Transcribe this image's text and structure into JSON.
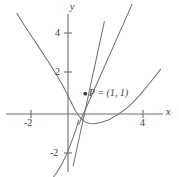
{
  "figure": {
    "name": "cubic-curve-with-tangent-and-secant",
    "background": "#ffffff",
    "curve_color": "#737373",
    "axis_color": "#6e6e6e",
    "text_color": "#3a3a3a",
    "axis_labels": {
      "x": "x",
      "y": "y"
    },
    "point_label": "P = (1, 1)"
  },
  "ticks": {
    "x": [
      {
        "label": "-2",
        "value": -2
      },
      {
        "label": "4",
        "value": 4
      }
    ],
    "y": [
      {
        "label": "4",
        "value": 4
      },
      {
        "label": "2",
        "value": 2
      },
      {
        "label": "-2",
        "value": -2
      }
    ]
  },
  "chart_data": {
    "type": "line",
    "title": "",
    "xlabel": "x",
    "ylabel": "y",
    "grid": false,
    "legend": "none",
    "xlim": [
      -3.1,
      5.6
    ],
    "ylim": [
      -3.1,
      5.4
    ],
    "xticks": [
      -2,
      4
    ],
    "yticks": [
      -2,
      2,
      4
    ],
    "annotations": [
      {
        "text": "P = (1, 1)",
        "x": 1,
        "y": 1,
        "marker": "dot"
      }
    ],
    "series": [
      {
        "name": "curve",
        "kind": "parametric-cubic",
        "description": "sideways cubic x = y^3 - 3y + 3 passing through P=(1,1)",
        "points_x": [
          -2.95,
          -2.55,
          -2.15,
          -1.75,
          -1.4,
          -1.08,
          -0.8,
          -0.55,
          -0.33,
          -0.14,
          0.02,
          0.17,
          0.31,
          0.45,
          0.6,
          0.77,
          0.97,
          1.0,
          1.22,
          1.52,
          1.9,
          2.37,
          2.9,
          3.3,
          3.7,
          4.2,
          4.75,
          5.35
        ],
        "points_y": [
          4.95,
          4.4,
          3.88,
          3.38,
          2.92,
          2.5,
          2.12,
          1.76,
          1.44,
          1.14,
          0.86,
          0.6,
          0.36,
          0.14,
          -0.06,
          -0.24,
          -0.38,
          -0.4,
          -0.47,
          -0.48,
          -0.42,
          -0.28,
          -0.02,
          0.22,
          0.52,
          0.98,
          1.55,
          2.2
        ]
      },
      {
        "name": "lower-branch",
        "kind": "curve-tail",
        "description": "lower-left descending branch of the same cubic",
        "points_x": [
          0.62,
          0.48,
          0.3,
          0.1,
          -0.12,
          -0.38,
          -0.68,
          -1.0,
          -1.35
        ],
        "points_y": [
          -0.3,
          -0.7,
          -1.15,
          -1.6,
          -2.05,
          -2.5,
          -2.92,
          -3.3,
          -3.62
        ]
      },
      {
        "name": "tangent-line",
        "kind": "line",
        "description": "tangent to the curve at P = (1, 1)",
        "x0": 0.3,
        "y0": -2.55,
        "x1": 2.1,
        "y1": 4.55
      },
      {
        "name": "secant-line",
        "kind": "line",
        "description": "secant line through P = (1, 1) with smaller slope",
        "x0": 0.62,
        "y0": -0.52,
        "x1": 3.7,
        "y1": 5.4
      }
    ]
  }
}
